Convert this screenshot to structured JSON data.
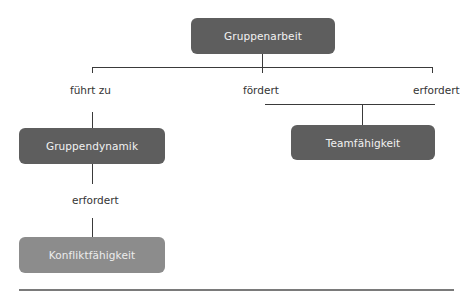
{
  "diagram": {
    "root": {
      "label": "Gruppenarbeit"
    },
    "edges": {
      "fuehrt_zu": "führt zu",
      "foerdert": "fördert",
      "erfordert_right": "erfordert",
      "erfordert_left": "erfordert"
    },
    "nodes": {
      "gruppendynamik": "Gruppendynamik",
      "teamfaehigkeit": "Teamfähigkeit",
      "konfliktfaehigkeit": "Konfliktfähigkeit"
    },
    "colors": {
      "dark_node": "#5e5e5e",
      "light_node": "#8c8c8c",
      "line": "#3a3a3a"
    }
  }
}
